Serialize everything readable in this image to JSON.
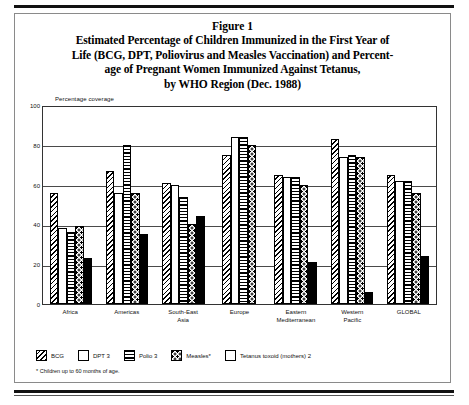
{
  "figure": {
    "number_label": "Figure 1",
    "caption_lines": [
      "Estimated Percentage of Children Immunized in the First Year of",
      "Life (BCG, DPT, Poliovirus and Measles Vaccination) and Percent-",
      "age of Pregnant Women Immunized Against Tetanus,",
      "by WHO Region (Dec. 1988)"
    ],
    "footnote": "* Children up to 60 months of age."
  },
  "chart_data": {
    "type": "bar",
    "xlabel": "",
    "ylabel": "Percentage coverage",
    "ylim": [
      0,
      100
    ],
    "yticks": [
      0,
      20,
      40,
      60,
      80,
      100
    ],
    "grid": true,
    "legend_position": "below-plot",
    "categories": [
      "Africa",
      "Americas",
      "South-East Asia",
      "Europe",
      "Eastern Mediterranean",
      "Western Pacific",
      "GLOBAL"
    ],
    "series": [
      {
        "name": "BCG",
        "pattern": "diagonal-hatch",
        "values": [
          56,
          67,
          61,
          75,
          65,
          83,
          65
        ]
      },
      {
        "name": "DPT 3",
        "pattern": "sparse-dots",
        "values": [
          38,
          56,
          60,
          84,
          64,
          74,
          62
        ]
      },
      {
        "name": "Polio 3",
        "pattern": "horizontal-lines",
        "values": [
          36,
          80,
          54,
          84,
          64,
          75,
          62
        ]
      },
      {
        "name": "Measles*",
        "pattern": "bold-dots",
        "values": [
          39,
          56,
          40,
          80,
          60,
          74,
          56
        ]
      },
      {
        "name": "Tetanus toxoid (mothers) 2",
        "pattern": "solid-black",
        "values": [
          23,
          35,
          44,
          null,
          21,
          6,
          24
        ]
      }
    ]
  },
  "legend": {
    "items": [
      {
        "label": "BCG"
      },
      {
        "label": "DPT 3"
      },
      {
        "label": "Polio 3"
      },
      {
        "label": "Measles*"
      },
      {
        "label": "Tetanus toxoid (mothers) 2"
      }
    ]
  }
}
